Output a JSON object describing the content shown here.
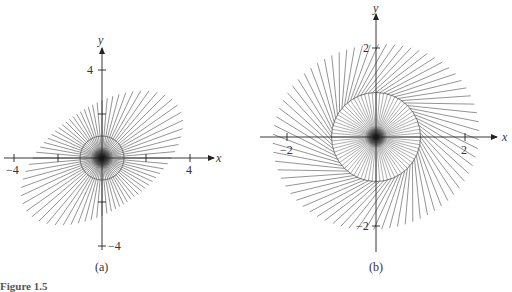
{
  "figure": {
    "caption": "Figure 1.5",
    "panels": [
      {
        "id": "a",
        "label": "(a)",
        "x_axis_label": "x",
        "y_axis_label": "y",
        "x_ticks": [
          "−4",
          "4"
        ],
        "y_ticks": [
          "4",
          "−4"
        ],
        "origin_px": [
          102,
          158
        ],
        "unit_px": 22
      },
      {
        "id": "b",
        "label": "(b)",
        "x_axis_label": "x",
        "y_axis_label": "y",
        "x_ticks": [
          "−2",
          "2"
        ],
        "y_ticks": [
          "2",
          "−2"
        ],
        "origin_px": [
          376,
          137
        ],
        "unit_px": 44.5
      }
    ]
  },
  "chart_data": [
    {
      "type": "diagram",
      "title": "(a)",
      "description": "Radial line segments through origin with unit circle; segments longer toward upper-right and lower-left (elliptical envelope tilted ~45°)",
      "xlabel": "x",
      "ylabel": "y",
      "xlim": [
        -4.5,
        4.5
      ],
      "ylim": [
        -4.5,
        4.5
      ],
      "x_tick_labels": [
        -4,
        4
      ],
      "y_tick_labels": [
        4,
        -4
      ],
      "circle_radius": 1,
      "num_rays": 72,
      "envelope": {
        "type": "ellipse",
        "semi_major": 4.2,
        "semi_minor": 2.3,
        "major_axis_angle_deg": 35
      }
    },
    {
      "type": "diagram",
      "title": "(b)",
      "description": "Radial segments with unit circle; inner rays to circle, outer segments rotated (swirl) forming near-circular envelope",
      "xlabel": "x",
      "ylabel": "y",
      "xlim": [
        -2.6,
        2.6
      ],
      "ylim": [
        -2.6,
        2.6
      ],
      "x_tick_labels": [
        -2,
        2
      ],
      "y_tick_labels": [
        2,
        -2
      ],
      "circle_radius": 1,
      "num_rays": 72,
      "outer_radius": 2.2
    }
  ]
}
